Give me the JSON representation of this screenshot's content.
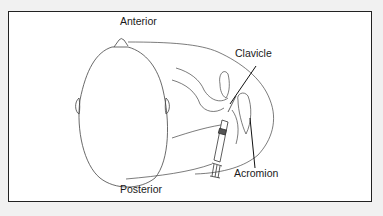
{
  "diagram": {
    "type": "anatomical-illustration",
    "labels": {
      "anterior": "Anterior",
      "posterior": "Posterior",
      "clavicle": "Clavicle",
      "acromion": "Acromion"
    },
    "colors": {
      "background": "#f1f1f1",
      "panel": "#ffffff",
      "border": "#222222",
      "line": "#444444",
      "syringe_plunger": "#555555"
    }
  }
}
